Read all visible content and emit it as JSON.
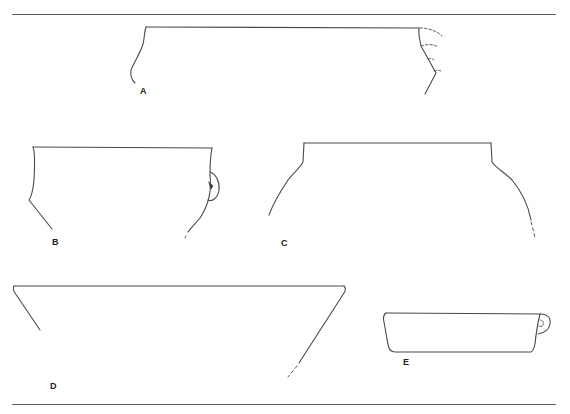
{
  "figure": {
    "type": "pottery-profile-drawings",
    "line_color": "#4a4a4a",
    "labels": {
      "a": "A",
      "b": "B",
      "c": "C",
      "d": "D",
      "e": "E"
    },
    "vessels": [
      {
        "id": "A",
        "description": "wide jar rim with slightly everted lip; right side shows dashed reconstructed lug/handle outlines"
      },
      {
        "id": "B",
        "description": "jar rim with vertical neck and carinated shoulder; small lug on right side"
      },
      {
        "id": "C",
        "description": "wide-mouthed jar with short vertical neck and rounded shoulder; dashed continuation bottom right"
      },
      {
        "id": "D",
        "description": "open conical bowl with flaring walls; dashed continuation bottom right"
      },
      {
        "id": "E",
        "description": "shallow straight-sided dish with small loop handle on right"
      }
    ]
  },
  "caption": ""
}
